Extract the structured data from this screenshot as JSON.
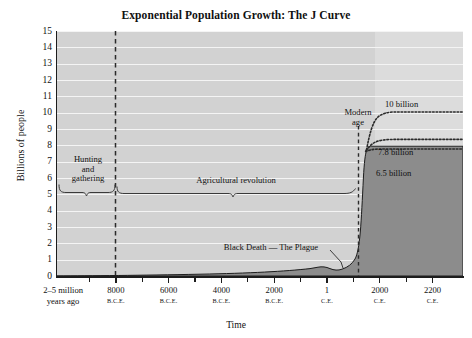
{
  "chart_data": {
    "type": "area",
    "title": "Exponential Population Growth: The J Curve",
    "xlabel": "Time",
    "ylabel": "Billions of people",
    "ylim": [
      0,
      15
    ],
    "ytick_labels": [
      "15",
      "14",
      "13",
      "12",
      "11",
      "10",
      "9",
      "8",
      "7",
      "6",
      "5",
      "4",
      "3",
      "2",
      "1",
      "0"
    ],
    "yticks": [
      15,
      14,
      13,
      12,
      11,
      10,
      9,
      8,
      7,
      6,
      5,
      4,
      3,
      2,
      1,
      0
    ],
    "grid": "horizontal-white",
    "legend": "none",
    "x_tick_labels": [
      {
        "value": "2–5 million",
        "line2": "years ago",
        "era": ""
      },
      {
        "value": "8000",
        "era": "B.C.E."
      },
      {
        "value": "6000",
        "era": "B.C.E."
      },
      {
        "value": "4000",
        "era": "B.C.E."
      },
      {
        "value": "2000",
        "era": "B.C.E."
      },
      {
        "value": "1",
        "era": "C.E."
      },
      {
        "value": "2000",
        "era": "C.E."
      },
      {
        "value": "2200",
        "era": "C.E."
      }
    ],
    "series": [
      {
        "name": "World population (historical)",
        "style": "filled-area",
        "color": "#8c8c8c",
        "points": [
          {
            "x": "2-5 million years ago",
            "y": 0.0
          },
          {
            "x": "8000 B.C.E.",
            "y": 0.005
          },
          {
            "x": "4000 B.C.E.",
            "y": 0.03
          },
          {
            "x": "1 C.E.",
            "y": 0.2
          },
          {
            "x": "1347 C.E.",
            "y": 0.45
          },
          {
            "x": "1400 C.E. (Black Death)",
            "y": 0.37
          },
          {
            "x": "1800 C.E.",
            "y": 1.0
          },
          {
            "x": "1900 C.E.",
            "y": 1.6
          },
          {
            "x": "2000 C.E.",
            "y": 6.1
          },
          {
            "x": "2010 C.E.",
            "y": 6.9
          }
        ]
      },
      {
        "name": "Projection: 10 billion",
        "style": "dotted",
        "value": 10,
        "label": "10 billion"
      },
      {
        "name": "Projection: 7.8 billion",
        "style": "dotted",
        "value": 7.8,
        "label": "7.8 billion"
      },
      {
        "name": "Projection: 6.5 billion",
        "style": "dotted",
        "value": 6.5,
        "label": "6.5 billion"
      }
    ],
    "annotations": [
      {
        "id": "hunting",
        "text": "Hunting and gathering",
        "line1": "Hunting",
        "line2": "and",
        "line3": "gathering"
      },
      {
        "id": "agricultural",
        "text": "Agricultural revolution"
      },
      {
        "id": "modern",
        "line1": "Modern",
        "line2": "age"
      },
      {
        "id": "black-death",
        "text": "Black Death — The Plague"
      }
    ],
    "vertical_markers": [
      {
        "label": "8000 B.C.E.",
        "style": "dashed"
      },
      {
        "label": "Modern age (~2000 C.E.)",
        "style": "dashed"
      }
    ]
  },
  "chart": {
    "title": "Exponential Population Growth: The J Curve",
    "ylabel": "Billions of people",
    "xlabel": "Time",
    "y_ticks": [
      "15",
      "14",
      "13",
      "12",
      "11",
      "10",
      "9",
      "8",
      "7",
      "6",
      "5",
      "4",
      "3",
      "2",
      "1",
      "0"
    ],
    "x_ticks": [
      {
        "main": "2–5 million",
        "sub": "years ago",
        "era": ""
      },
      {
        "main": "8000",
        "sub": "",
        "era": "B.C.E."
      },
      {
        "main": "6000",
        "sub": "",
        "era": "B.C.E."
      },
      {
        "main": "4000",
        "sub": "",
        "era": "B.C.E."
      },
      {
        "main": "2000",
        "sub": "",
        "era": "B.C.E."
      },
      {
        "main": "1",
        "sub": "",
        "era": "C.E."
      },
      {
        "main": "2000",
        "sub": "",
        "era": "C.E."
      },
      {
        "main": "2200",
        "sub": "",
        "era": "C.E."
      }
    ],
    "annotations": {
      "hunting_l1": "Hunting",
      "hunting_l2": "and",
      "hunting_l3": "gathering",
      "agricultural": "Agricultural revolution",
      "modern_l1": "Modern",
      "modern_l2": "age",
      "black_death": "Black Death — The Plague",
      "proj_10": "10 billion",
      "proj_78": "7.8 billion",
      "proj_65": "6.5 billion"
    },
    "colors": {
      "plot_background": "#d2d2d2",
      "future_background": "#dcdcdc",
      "gridline": "#f4f4f4",
      "population_fill": "#8c8c8c",
      "axis": "#1d1d1d",
      "text": "#111111"
    }
  }
}
